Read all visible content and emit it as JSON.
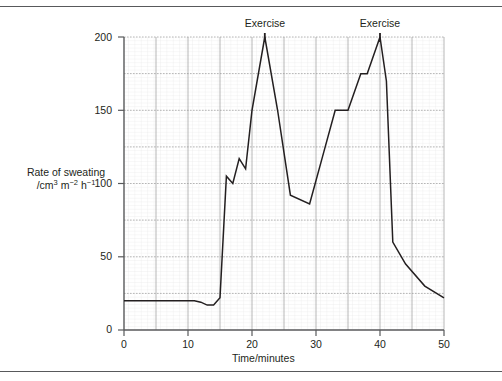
{
  "figure": {
    "top_rule_color": "#58595b",
    "bottom_rule_color": "#58595b"
  },
  "chart_data": {
    "type": "line",
    "title": "",
    "xlabel": "Time/minutes",
    "ylabel_line1": "Rate of sweating",
    "ylabel_line2_prefix": "/cm",
    "ylabel_line2_sup1": "3",
    "ylabel_line2_mid": " m",
    "ylabel_line2_sup2": "−2",
    "ylabel_line2_mid2": " h",
    "ylabel_line2_sup3": "−1",
    "ylabel_plain": "Rate of sweating /cm3 m-2 h-1",
    "xlim": [
      0,
      50
    ],
    "ylim": [
      0,
      200
    ],
    "xticks": [
      "0",
      "10",
      "20",
      "30",
      "40",
      "50"
    ],
    "xtick_values": [
      0,
      10,
      20,
      30,
      40,
      50
    ],
    "yticks": [
      "0",
      "50",
      "100",
      "150",
      "200"
    ],
    "ytick_values": [
      0,
      50,
      100,
      150,
      200
    ],
    "grid": true,
    "grid_major_x_step": 5,
    "grid_major_y_step": 25,
    "grid_minor_x_step": 1,
    "grid_minor_y_step": 2.5,
    "legend": "none",
    "line_color": "#231f20",
    "x": [
      0,
      3,
      6,
      9,
      11,
      12,
      13,
      14,
      15,
      16,
      17,
      18,
      19,
      20,
      22,
      24,
      26,
      29,
      31,
      33,
      35,
      37,
      38,
      40,
      41,
      42,
      44,
      47,
      50
    ],
    "values": [
      20,
      20,
      20,
      20,
      20,
      19,
      17,
      17,
      22,
      105,
      100,
      117,
      110,
      150,
      200,
      150,
      92,
      86,
      118,
      150,
      150,
      175,
      175,
      200,
      170,
      60,
      45,
      30,
      22
    ],
    "series": [
      {
        "name": "Rate of sweating",
        "points": [
          {
            "x": 0,
            "y": 20
          },
          {
            "x": 3,
            "y": 20
          },
          {
            "x": 6,
            "y": 20
          },
          {
            "x": 9,
            "y": 20
          },
          {
            "x": 11,
            "y": 20
          },
          {
            "x": 12,
            "y": 19
          },
          {
            "x": 13,
            "y": 17
          },
          {
            "x": 14,
            "y": 17
          },
          {
            "x": 15,
            "y": 22
          },
          {
            "x": 16,
            "y": 105
          },
          {
            "x": 17,
            "y": 100
          },
          {
            "x": 18,
            "y": 117
          },
          {
            "x": 19,
            "y": 110
          },
          {
            "x": 20,
            "y": 150
          },
          {
            "x": 22,
            "y": 200
          },
          {
            "x": 24,
            "y": 150
          },
          {
            "x": 26,
            "y": 92
          },
          {
            "x": 29,
            "y": 86
          },
          {
            "x": 31,
            "y": 118
          },
          {
            "x": 33,
            "y": 150
          },
          {
            "x": 35,
            "y": 150
          },
          {
            "x": 37,
            "y": 175
          },
          {
            "x": 38,
            "y": 175
          },
          {
            "x": 40,
            "y": 200
          },
          {
            "x": 41,
            "y": 170
          },
          {
            "x": 42,
            "y": 60
          },
          {
            "x": 44,
            "y": 45
          },
          {
            "x": 47,
            "y": 30
          },
          {
            "x": 50,
            "y": 22
          }
        ]
      }
    ],
    "annotations": [
      {
        "label": "Exercise",
        "x": 22,
        "marker_x": 22
      },
      {
        "label": "Exercise",
        "x": 40,
        "marker_x": 40
      }
    ]
  }
}
